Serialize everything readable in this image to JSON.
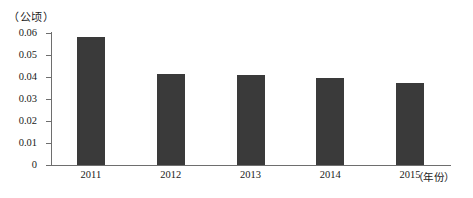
{
  "chart_data": {
    "type": "bar",
    "title": "",
    "subtitle": "",
    "xlabel": "（年份）",
    "ylabel": "（公顷）",
    "categories": [
      "2011",
      "2012",
      "2013",
      "2014",
      "2015"
    ],
    "values": [
      0.058,
      0.0415,
      0.041,
      0.0395,
      0.0375
    ],
    "series": [
      {
        "name": "",
        "values": [
          0.058,
          0.0415,
          0.041,
          0.0395,
          0.0375
        ]
      }
    ],
    "ylim": [
      0,
      0.06
    ],
    "xlim_note": "categorical",
    "ytick_labels": [
      "0",
      "0.01",
      "0.02",
      "0.03",
      "0.04",
      "0.05",
      "0.06"
    ],
    "ytick_values": [
      0,
      0.01,
      0.02,
      0.03,
      0.04,
      0.05,
      0.06
    ],
    "grid": false,
    "legend": false,
    "legend_position": "none",
    "bar_color": "#3a3a3a",
    "axis_color": "#6e6e6e",
    "background_color": "#ffffff",
    "annotations": []
  }
}
